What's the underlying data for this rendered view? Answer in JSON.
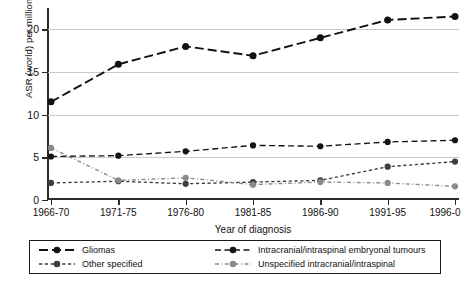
{
  "chart_data": {
    "type": "line",
    "title": "",
    "xlabel": "Year of diagnosis",
    "ylabel": "ASR (world) per million child-years",
    "categories": [
      "1966-70",
      "1971-75",
      "1976-80",
      "1981-85",
      "1986-90",
      "1991-95",
      "1996-0"
    ],
    "ylim": [
      0,
      22.5
    ],
    "yticks": [
      0,
      5,
      10,
      15,
      20
    ],
    "ytick_labels": [
      "0",
      "5",
      "10",
      "15",
      "20"
    ],
    "grid": "horizontal",
    "legend_position": "bottom",
    "series": [
      {
        "name": "Gliomas",
        "values": [
          11.5,
          15.9,
          18.0,
          16.9,
          19.0,
          21.1,
          21.5
        ],
        "color": "#111111",
        "dash": "long-dash",
        "marker": "circle"
      },
      {
        "name": "Intracranial/intraspinal embryonal tumours",
        "values": [
          5.1,
          5.2,
          5.7,
          6.4,
          6.3,
          6.8,
          7.0
        ],
        "color": "#141414",
        "dash": "medium-dash",
        "marker": "circle"
      },
      {
        "name": "Other specified",
        "values": [
          2.0,
          2.2,
          1.9,
          2.1,
          2.3,
          3.9,
          4.5
        ],
        "color": "#3d3d3d",
        "dash": "short-dash",
        "marker": "circle"
      },
      {
        "name": "Unspecified intracranial/intraspinal",
        "values": [
          6.1,
          2.3,
          2.6,
          1.8,
          2.1,
          2.0,
          1.6
        ],
        "color": "#8a8a8a",
        "dash": "dash-dot",
        "marker": "circle"
      }
    ]
  },
  "legend": {
    "entries": [
      "Gliomas",
      "Intracranial/intraspinal embryonal tumours",
      "Other specified",
      "Unspecified intracranial/intraspinal"
    ]
  }
}
